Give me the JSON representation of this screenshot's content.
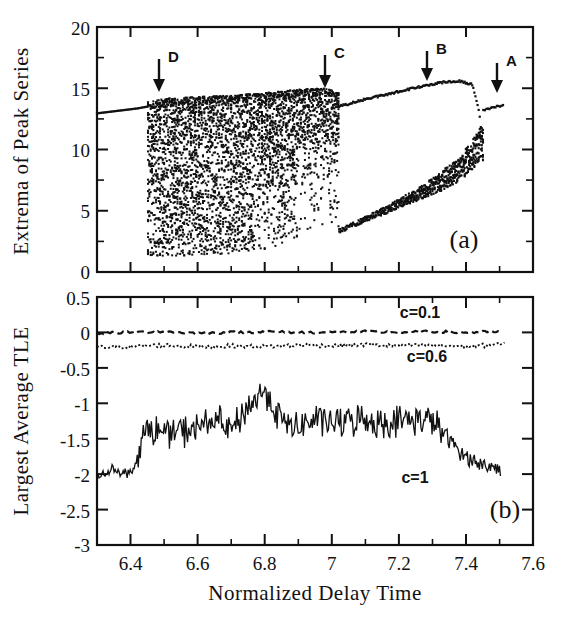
{
  "figure": {
    "background": "#ffffff",
    "ink_color": "#111111"
  },
  "panel_a": {
    "label": "(a)",
    "ylabel": "Extrema of Peak Series",
    "y_ticks": [
      "0",
      "5",
      "10",
      "15",
      "20"
    ],
    "y_tick_values": [
      0,
      5,
      10,
      15,
      20
    ],
    "ylim": [
      0,
      20
    ],
    "xlim": [
      6.3,
      7.6
    ],
    "annotations": [
      {
        "label": "A",
        "x": 7.49
      },
      {
        "label": "B",
        "x": 7.31
      },
      {
        "label": "C",
        "x": 6.98
      },
      {
        "label": "D",
        "x": 6.47
      }
    ]
  },
  "panel_b": {
    "label": "(b)",
    "ylabel": "Largest Average TLE",
    "xlabel": "Normalized Delay Time",
    "y_ticks": [
      "0.5",
      "0",
      "-0.5",
      "-1",
      "-1.5",
      "-2",
      "-2.5",
      "-3"
    ],
    "y_tick_values": [
      0.5,
      0,
      -0.5,
      -1,
      -1.5,
      -2,
      -2.5,
      -3
    ],
    "x_ticks": [
      "6.4",
      "6.6",
      "6.8",
      "7",
      "7.2",
      "7.4",
      "7.6"
    ],
    "x_tick_values": [
      6.4,
      6.6,
      6.8,
      7.0,
      7.2,
      7.4,
      7.6
    ],
    "ylim": [
      -3,
      0.5
    ],
    "xlim": [
      6.3,
      7.6
    ],
    "series_labels": [
      {
        "text": "c=0.1",
        "x": 7.26,
        "y": 0.21
      },
      {
        "text": "c=0.6",
        "x": 7.28,
        "y": -0.42
      },
      {
        "text": "c=1",
        "x": 7.22,
        "y": -2.09
      }
    ]
  },
  "chart_data": [
    {
      "type": "scatter",
      "id": "panel-a-bifurcation",
      "title": "(a)",
      "xlabel": "Normalized Delay Time",
      "ylabel": "Extrema of Peak Series",
      "xlim": [
        6.3,
        7.6
      ],
      "ylim": [
        0,
        20
      ],
      "xticks": [
        6.4,
        6.6,
        6.8,
        7.0,
        7.2,
        7.4,
        7.6
      ],
      "yticks": [
        0,
        5,
        10,
        15,
        20
      ],
      "grid": false,
      "legend": "none",
      "description": "Bifurcation diagram of extrema of the peak series versus normalized delay time. A single period-1 branch near y=13 exists for tau<6.45, a broad chaotic band (y from ~1.3 to ~15) spans 6.45<tau<7.02, a period-2 regime with an upper branch rising from ~13.5 to ~15.6 and a lower branch rising from ~3 to ~10 spans 7.02<tau<7.42, then a period-1 branch near y=13.5 resumes for tau>7.45.",
      "branches": [
        {
          "name": "period-1-left",
          "x": [
            6.3,
            6.33,
            6.36,
            6.39,
            6.42,
            6.45
          ],
          "y": [
            12.95,
            13.05,
            13.15,
            13.25,
            13.35,
            13.5
          ]
        },
        {
          "name": "chaotic-band-upper-envelope",
          "x": [
            6.45,
            6.52,
            6.6,
            6.7,
            6.8,
            6.9,
            6.98,
            7.02
          ],
          "y": [
            13.9,
            14.2,
            14.3,
            14.4,
            14.6,
            14.9,
            15.0,
            14.6
          ]
        },
        {
          "name": "chaotic-band-lower-envelope",
          "x": [
            6.45,
            6.52,
            6.6,
            6.7,
            6.8,
            6.9,
            6.98,
            7.02
          ],
          "y": [
            1.35,
            1.3,
            1.4,
            1.5,
            1.7,
            2.6,
            3.2,
            3.4
          ]
        },
        {
          "name": "period-2-upper",
          "x": [
            7.02,
            7.1,
            7.18,
            7.26,
            7.32,
            7.38,
            7.42,
            7.44,
            7.45
          ],
          "y": [
            13.5,
            14.1,
            14.6,
            15.1,
            15.45,
            15.6,
            15.3,
            13.0,
            10.5
          ]
        },
        {
          "name": "period-2-lower",
          "x": [
            7.02,
            7.1,
            7.18,
            7.26,
            7.32,
            7.38,
            7.42,
            7.44
          ],
          "y": [
            3.3,
            4.3,
            5.3,
            6.4,
            7.3,
            8.4,
            9.6,
            10.4
          ]
        },
        {
          "name": "period-1-right",
          "x": [
            7.45,
            7.47,
            7.49,
            7.51
          ],
          "y": [
            13.2,
            13.35,
            13.5,
            13.6
          ]
        }
      ]
    },
    {
      "type": "line",
      "id": "panel-b-tle",
      "title": "(b)",
      "xlabel": "Normalized Delay Time",
      "ylabel": "Largest Average TLE",
      "xlim": [
        6.3,
        7.6
      ],
      "ylim": [
        -3,
        0.5
      ],
      "xticks": [
        6.4,
        6.6,
        6.8,
        7.0,
        7.2,
        7.4,
        7.6
      ],
      "yticks": [
        0.5,
        0,
        -0.5,
        -1,
        -1.5,
        -2,
        -2.5,
        -3
      ],
      "grid": false,
      "legend": "inline-labels",
      "series": [
        {
          "name": "c=0.1",
          "style": "dashed",
          "mean": 0.0,
          "x": [
            6.3,
            6.4,
            6.5,
            6.6,
            6.7,
            6.8,
            6.9,
            7.0,
            7.1,
            7.2,
            7.3,
            7.4,
            7.5
          ],
          "values": [
            -0.01,
            0.0,
            0.01,
            -0.01,
            0.0,
            0.01,
            0.0,
            0.0,
            0.01,
            0.0,
            0.01,
            0.0,
            0.01
          ]
        },
        {
          "name": "c=0.6",
          "style": "dotted",
          "mean": -0.19,
          "x": [
            6.3,
            6.4,
            6.5,
            6.6,
            6.7,
            6.8,
            6.9,
            7.0,
            7.1,
            7.2,
            7.3,
            7.4,
            7.5
          ],
          "values": [
            -0.21,
            -0.2,
            -0.18,
            -0.2,
            -0.19,
            -0.2,
            -0.18,
            -0.19,
            -0.17,
            -0.19,
            -0.18,
            -0.2,
            -0.17
          ]
        },
        {
          "name": "c=1",
          "style": "solid",
          "mean": -1.35,
          "x": [
            6.3,
            6.35,
            6.4,
            6.45,
            6.5,
            6.55,
            6.6,
            6.65,
            6.7,
            6.75,
            6.8,
            6.85,
            6.9,
            6.95,
            7.0,
            7.05,
            7.1,
            7.15,
            7.2,
            7.25,
            7.3,
            7.35,
            7.4,
            7.45,
            7.5
          ],
          "values": [
            -2.02,
            -1.93,
            -2.0,
            -1.35,
            -1.42,
            -1.4,
            -1.35,
            -1.22,
            -1.4,
            -1.05,
            -0.82,
            -1.25,
            -1.35,
            -1.22,
            -1.28,
            -1.25,
            -1.22,
            -1.28,
            -1.25,
            -1.22,
            -1.24,
            -1.52,
            -1.75,
            -1.88,
            -1.92
          ]
        }
      ]
    }
  ]
}
